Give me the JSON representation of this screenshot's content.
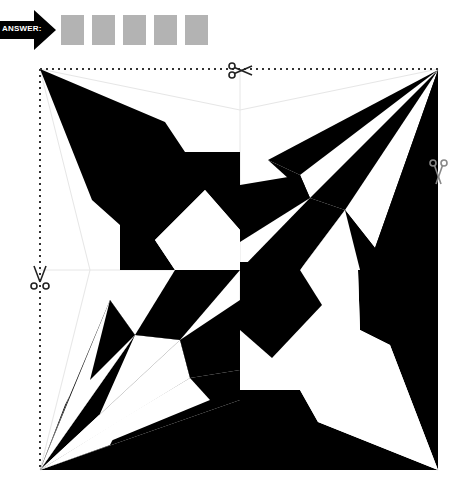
{
  "answer": {
    "label": "ANSWER:",
    "box_count": 5,
    "boxes": [
      "",
      "",
      "",
      "",
      ""
    ],
    "box_color": "#b3b3b3"
  },
  "puzzle": {
    "type": "fold-and-cut pinwheel pattern",
    "colors": {
      "fill": "#000000",
      "background": "#ffffff",
      "guide": "#e8e8e8",
      "cut_line": "#333333"
    },
    "square": {
      "left": 40,
      "top": 69,
      "right": 438,
      "bottom": 470,
      "center": [
        240,
        270
      ]
    },
    "cut_lines": [
      {
        "edge": "top",
        "style": "dotted"
      },
      {
        "edge": "left",
        "style": "dotted"
      }
    ],
    "scissors": [
      {
        "position": "top-edge",
        "x": 238,
        "y": 69,
        "icon": "scissors-icon"
      },
      {
        "position": "right-edge",
        "x": 438,
        "y": 172,
        "icon": "scissors-icon"
      },
      {
        "position": "left-edge",
        "x": 40,
        "y": 278,
        "icon": "scissors-icon"
      }
    ]
  }
}
